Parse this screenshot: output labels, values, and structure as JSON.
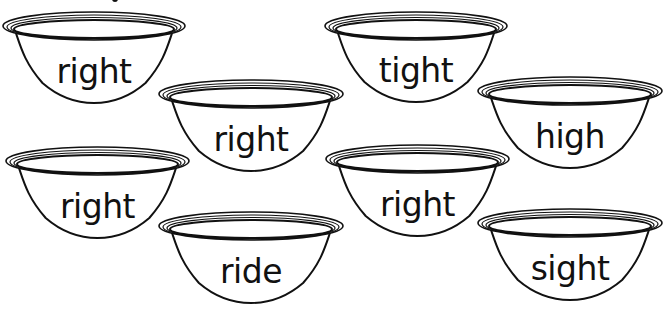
{
  "worksheet": {
    "bowls": [
      {
        "word": "right",
        "x": 2,
        "y": 10,
        "w": 184,
        "h": 95
      },
      {
        "word": "right",
        "x": 158,
        "y": 78,
        "w": 186,
        "h": 95
      },
      {
        "word": "tight",
        "x": 324,
        "y": 10,
        "w": 184,
        "h": 94
      },
      {
        "word": "high",
        "x": 477,
        "y": 75,
        "w": 186,
        "h": 95
      },
      {
        "word": "right",
        "x": 5,
        "y": 145,
        "w": 185,
        "h": 95
      },
      {
        "word": "right",
        "x": 325,
        "y": 143,
        "w": 185,
        "h": 95
      },
      {
        "word": "ride",
        "x": 158,
        "y": 210,
        "w": 186,
        "h": 95
      },
      {
        "word": "sight",
        "x": 477,
        "y": 207,
        "w": 186,
        "h": 95
      }
    ],
    "colors": {
      "line": "#111111",
      "background": "#ffffff"
    }
  }
}
